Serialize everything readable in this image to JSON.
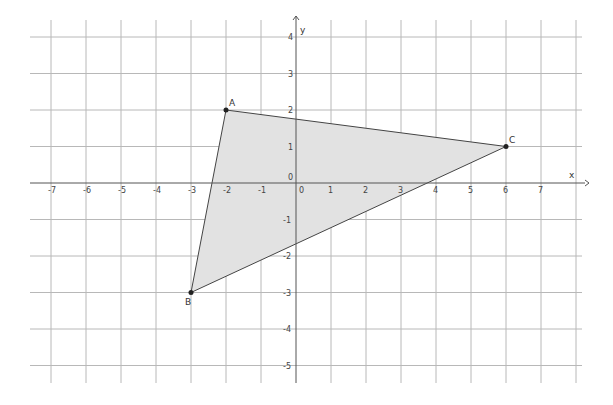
{
  "graph": {
    "x_axis_label": "x",
    "y_axis_label": "y",
    "origin_label": "0",
    "x_ticks": [
      "-7",
      "-6",
      "-5",
      "-4",
      "-3",
      "-2",
      "-1",
      "0",
      "1",
      "2",
      "3",
      "4",
      "5",
      "6",
      "7"
    ],
    "y_ticks": [
      "4",
      "3",
      "2",
      "1",
      "0",
      "-1",
      "-2",
      "-3",
      "-4",
      "-5"
    ],
    "colors": {
      "grid": "#b0b0b0",
      "axis": "#555555",
      "fill": "#e0e0e0",
      "edge": "#444444",
      "point": "#222222"
    }
  },
  "triangle": {
    "points": [
      {
        "label": "A",
        "x": -2,
        "y": 2
      },
      {
        "label": "B",
        "x": -3,
        "y": -3
      },
      {
        "label": "C",
        "x": 6,
        "y": 1
      }
    ]
  }
}
